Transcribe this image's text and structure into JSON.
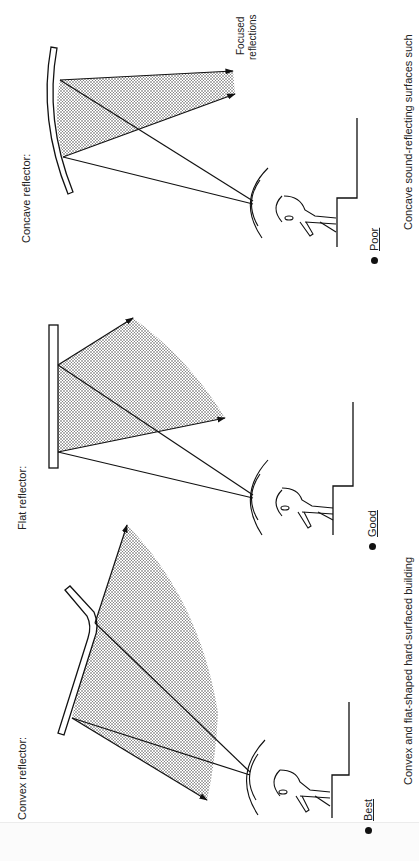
{
  "diagram": {
    "orientation": "rotated-90-ccw",
    "panels": [
      {
        "id": "concave",
        "label": "Concave reflector:",
        "rating": "Poor",
        "annotation_line1": "Focused",
        "annotation_line2": "reflections"
      },
      {
        "id": "flat",
        "label": "Flat reflector:",
        "rating": "Good"
      },
      {
        "id": "convex",
        "label": "Convex reflector:",
        "rating": "Best"
      }
    ],
    "captions": {
      "convex_flat": "Convex and flat-shaped hard-surfaced building",
      "concave": "Concave sound-reflecting surfaces such"
    },
    "colors": {
      "ink": "#1a1a1a",
      "stipple": "#555555",
      "paper": "#ffffff"
    }
  }
}
